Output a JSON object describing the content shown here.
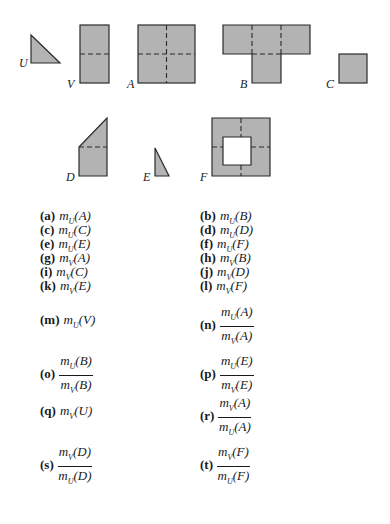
{
  "figure": {
    "fill_color": "#b3b3b3",
    "stroke_color": "#2a2a2a",
    "shapes": [
      {
        "id": "U",
        "label": "U",
        "kind": "right-triangle"
      },
      {
        "id": "V",
        "label": "V",
        "kind": "rectangle 1x2 units (split by dashed horizontal)"
      },
      {
        "id": "A",
        "label": "A",
        "kind": "square 2x2 (dashed cross)"
      },
      {
        "id": "B",
        "label": "B",
        "kind": "T-shape of 4 squares"
      },
      {
        "id": "C",
        "label": "C",
        "kind": "small square"
      },
      {
        "id": "D",
        "label": "D",
        "kind": "square with triangle on top"
      },
      {
        "id": "E",
        "label": "E",
        "kind": "thin right triangle"
      },
      {
        "id": "F",
        "label": "F",
        "kind": "square frame with square hole"
      }
    ]
  },
  "exercises": [
    {
      "tag": "(a)",
      "type": "simple",
      "m": "m",
      "sub": "U",
      "arg": "(A)"
    },
    {
      "tag": "(b)",
      "type": "simple",
      "m": "m",
      "sub": "U",
      "arg": "(B)"
    },
    {
      "tag": "(c)",
      "type": "simple",
      "m": "m",
      "sub": "U",
      "arg": "(C)"
    },
    {
      "tag": "(d)",
      "type": "simple",
      "m": "m",
      "sub": "U",
      "arg": "(D)"
    },
    {
      "tag": "(e)",
      "type": "simple",
      "m": "m",
      "sub": "U",
      "arg": "(E)"
    },
    {
      "tag": "(f)",
      "type": "simple",
      "m": "m",
      "sub": "U",
      "arg": "(F)"
    },
    {
      "tag": "(g)",
      "type": "simple",
      "m": "m",
      "sub": "V",
      "arg": "(A)"
    },
    {
      "tag": "(h)",
      "type": "simple",
      "m": "m",
      "sub": "V",
      "arg": "(B)"
    },
    {
      "tag": "(i)",
      "type": "simple",
      "m": "m",
      "sub": "V",
      "arg": "(C)"
    },
    {
      "tag": "(j)",
      "type": "simple",
      "m": "m",
      "sub": "V",
      "arg": "(D)"
    },
    {
      "tag": "(k)",
      "type": "simple",
      "m": "m",
      "sub": "V",
      "arg": "(E)"
    },
    {
      "tag": "(l)",
      "type": "simple",
      "m": "m",
      "sub": "V",
      "arg": "(F)"
    },
    {
      "tag": "(m)",
      "type": "simple",
      "m": "m",
      "sub": "U",
      "arg": "(V)"
    },
    {
      "tag": "(n)",
      "type": "fraction",
      "num": {
        "m": "m",
        "sub": "U",
        "arg": "(A)"
      },
      "den": {
        "m": "m",
        "sub": "V",
        "arg": "(A)"
      }
    },
    {
      "tag": "(o)",
      "type": "fraction",
      "num": {
        "m": "m",
        "sub": "U",
        "arg": "(B)"
      },
      "den": {
        "m": "m",
        "sub": "V",
        "arg": "(B)"
      }
    },
    {
      "tag": "(p)",
      "type": "fraction",
      "num": {
        "m": "m",
        "sub": "U",
        "arg": "(E)"
      },
      "den": {
        "m": "m",
        "sub": "V",
        "arg": "(E)"
      }
    },
    {
      "tag": "(q)",
      "type": "simple",
      "m": "m",
      "sub": "V",
      "arg": "(U)"
    },
    {
      "tag": "(r)",
      "type": "fraction",
      "num": {
        "m": "m",
        "sub": "V",
        "arg": "(A)"
      },
      "den": {
        "m": "m",
        "sub": "U",
        "arg": "(A)"
      }
    },
    {
      "tag": "(s)",
      "type": "fraction",
      "num": {
        "m": "m",
        "sub": "V",
        "arg": "(D)"
      },
      "den": {
        "m": "m",
        "sub": "U",
        "arg": "(D)"
      }
    },
    {
      "tag": "(t)",
      "type": "fraction",
      "num": {
        "m": "m",
        "sub": "V",
        "arg": "(F)"
      },
      "den": {
        "m": "m",
        "sub": "U",
        "arg": "(F)"
      }
    }
  ]
}
